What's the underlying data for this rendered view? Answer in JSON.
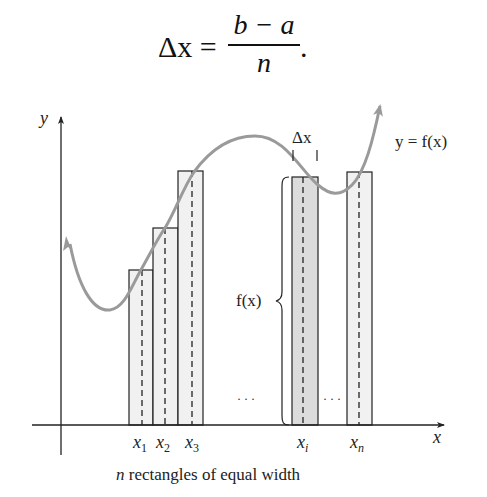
{
  "formula": {
    "lhs": "Δx =",
    "numerator": "b − a",
    "denominator": "n",
    "trailing": "."
  },
  "figure": {
    "axis_labels": {
      "x": "x",
      "y": "y"
    },
    "curve_label": "y = f(x)",
    "width_label": "Δx",
    "height_label": "f(x)",
    "ellipsis_left": "· · ·",
    "ellipsis_right": "· · ·",
    "sample_points": [
      {
        "base": "x",
        "sub": "1"
      },
      {
        "base": "x",
        "sub": "2"
      },
      {
        "base": "x",
        "sub": "3"
      },
      {
        "base": "x",
        "sub": "i"
      },
      {
        "base": "x",
        "sub": "n"
      }
    ],
    "caption": {
      "var": "n",
      "text": " rectangles of equal width"
    },
    "colors": {
      "curve": "#9a9a9a",
      "rect_fill": "#f1f1f1",
      "rect_highlight_fill": "#dcdcdc",
      "stroke": "#222222"
    },
    "rectangles": [
      {
        "name": "rect-1",
        "x": 129,
        "w": 24,
        "top": 270,
        "highlight": false
      },
      {
        "name": "rect-2",
        "x": 153,
        "w": 25,
        "top": 228,
        "highlight": false
      },
      {
        "name": "rect-3",
        "x": 178,
        "w": 25,
        "top": 171,
        "highlight": false
      },
      {
        "name": "rect-i",
        "x": 292,
        "w": 26,
        "top": 177,
        "highlight": true
      },
      {
        "name": "rect-n",
        "x": 347,
        "w": 25,
        "top": 172,
        "highlight": false
      }
    ]
  }
}
